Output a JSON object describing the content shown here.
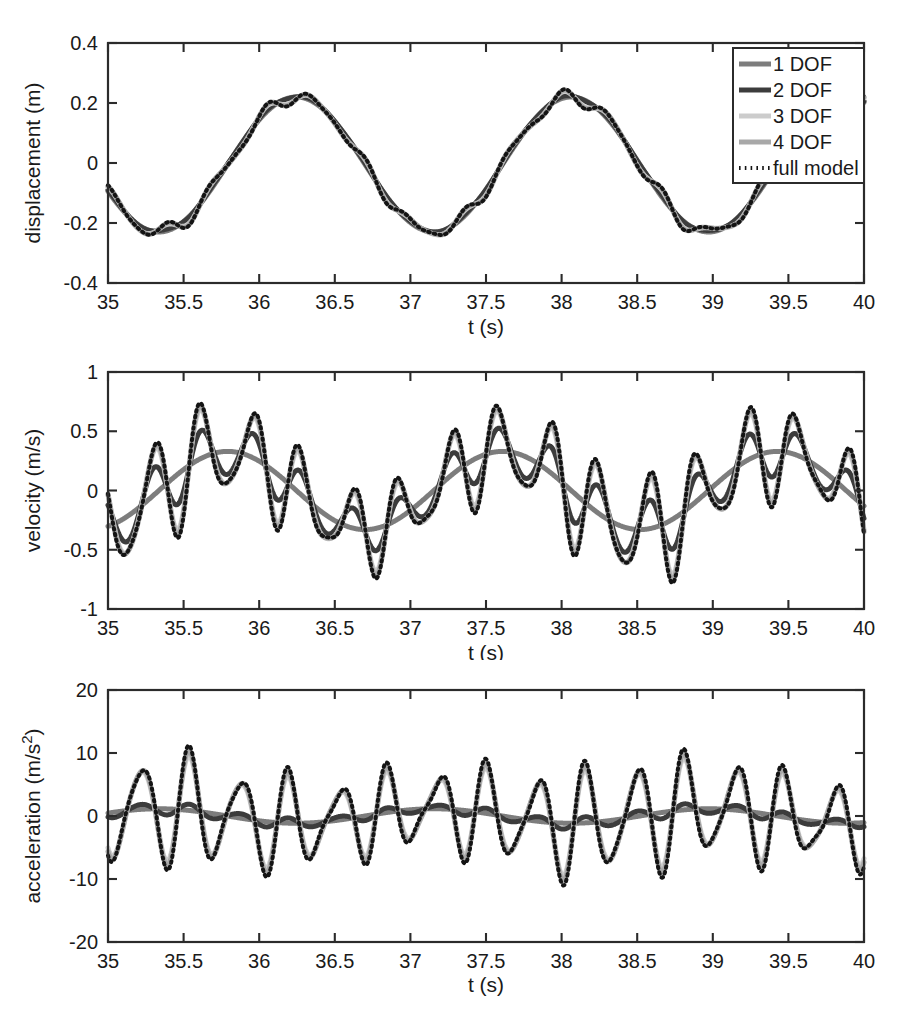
{
  "figure": {
    "title": "",
    "background": "#ffffff",
    "n_subplots": 3
  },
  "legend": {
    "position": "top-right-of-first-subplot",
    "entries": [
      {
        "label": "1 DOF",
        "color": "#7d7d7d",
        "style": "solid",
        "width": 5
      },
      {
        "label": "2 DOF",
        "color": "#3c3c3c",
        "style": "solid",
        "width": 5
      },
      {
        "label": "3 DOF",
        "color": "#cccccc",
        "style": "solid",
        "width": 5
      },
      {
        "label": "4 DOF",
        "color": "#a8a8a8",
        "style": "solid",
        "width": 5
      },
      {
        "label": "full model",
        "color": "#141414",
        "style": "dotted",
        "width": 4
      }
    ]
  },
  "chart_data": [
    {
      "type": "line",
      "id": "displacement",
      "title": "",
      "xlabel": "t (s)",
      "ylabel": "displacement (m)",
      "xlim": [
        35,
        40
      ],
      "ylim": [
        -0.4,
        0.4
      ],
      "xticks": [
        35,
        35.5,
        36,
        36.5,
        37,
        37.5,
        38,
        38.5,
        39,
        39.5,
        40
      ],
      "xticklabels": [
        "35",
        "35.5",
        "36",
        "36.5",
        "37",
        "37.5",
        "38",
        "38.5",
        "39",
        "39.5",
        "40"
      ],
      "yticks": [
        -0.4,
        -0.2,
        0,
        0.2,
        0.4
      ],
      "yticklabels": [
        "-0.4",
        "-0.2",
        "0",
        "0.2",
        "0.4"
      ],
      "grid": false,
      "slow": {
        "amp": 0.225,
        "freq": 0.55,
        "phase": 3.55,
        "offset": -0.005
      },
      "ripple": {
        "amp": 0.022,
        "freq": 3.05,
        "phase": 0.6
      },
      "ripple2": {
        "amp": 0.009,
        "freq": 4.6,
        "phase": 2.1
      },
      "series": [
        {
          "name": "1 DOF",
          "color": "#7d7d7d",
          "style": "solid",
          "width": 5,
          "ripple_scale": 0.0,
          "ripple2_scale": 0.0,
          "dy": 0.0
        },
        {
          "name": "2 DOF",
          "color": "#3c3c3c",
          "style": "solid",
          "width": 5,
          "ripple_scale": 0.18,
          "ripple2_scale": 0.05,
          "dy": 0.002
        },
        {
          "name": "3 DOF",
          "color": "#cccccc",
          "style": "solid",
          "width": 5,
          "ripple_scale": 0.85,
          "ripple2_scale": 0.5,
          "dy": 0.0
        },
        {
          "name": "4 DOF",
          "color": "#a8a8a8",
          "style": "solid",
          "width": 5,
          "ripple_scale": 0.95,
          "ripple2_scale": 0.8,
          "dy": 0.0
        },
        {
          "name": "full model",
          "color": "#141414",
          "style": "dotted",
          "width": 4,
          "ripple_scale": 1.0,
          "ripple2_scale": 1.0,
          "dy": 0.0
        }
      ],
      "notes": "smooth low-frequency carrier, peak ~0.21 m near t=37.05, trough ~-0.27 m near t=38.7, start ~-0.23 m at t=35"
    },
    {
      "type": "line",
      "id": "velocity",
      "title": "",
      "xlabel": "t (s)",
      "ylabel": "velocity (m/s)",
      "xlim": [
        35,
        40
      ],
      "ylim": [
        -1,
        1
      ],
      "xticks": [
        35,
        35.5,
        36,
        36.5,
        37,
        37.5,
        38,
        38.5,
        39,
        39.5,
        40
      ],
      "xticklabels": [
        "35",
        "35.5",
        "36",
        "36.5",
        "37",
        "37.5",
        "38",
        "38.5",
        "39",
        "39.5",
        "40"
      ],
      "yticks": [
        -1,
        -0.5,
        0,
        0.5,
        1
      ],
      "yticklabels": [
        "-1",
        "-0.5",
        "0",
        "0.5",
        "1"
      ],
      "grid": false,
      "slow": {
        "amp": 0.33,
        "freq": 0.55,
        "phase": 5.12,
        "offset": 0.0
      },
      "ripple": {
        "amp": 0.42,
        "freq": 3.05,
        "phase": 2.17
      },
      "ripple2": {
        "amp": 0.13,
        "freq": 4.6,
        "phase": 3.67
      },
      "series": [
        {
          "name": "1 DOF",
          "color": "#7d7d7d",
          "style": "solid",
          "width": 5,
          "ripple_scale": 0.0,
          "ripple2_scale": 0.0,
          "dy": 0.0
        },
        {
          "name": "2 DOF",
          "color": "#3c3c3c",
          "style": "solid",
          "width": 5,
          "ripple_scale": 0.56,
          "ripple2_scale": 0.18,
          "dy": 0.0
        },
        {
          "name": "3 DOF",
          "color": "#cccccc",
          "style": "solid",
          "width": 5,
          "ripple_scale": 0.92,
          "ripple2_scale": 0.72,
          "dy": 0.0
        },
        {
          "name": "4 DOF",
          "color": "#a8a8a8",
          "style": "solid",
          "width": 5,
          "ripple_scale": 0.97,
          "ripple2_scale": 0.88,
          "dy": 0.0
        },
        {
          "name": "full model",
          "color": "#141414",
          "style": "dotted",
          "width": 4,
          "ripple_scale": 1.0,
          "ripple2_scale": 1.0,
          "dy": 0.0
        }
      ],
      "notes": "slow carrier +-0.35 m/s; full model oscillates to ~+0.9 near t=36.0 and ~-0.8 near t=37.45"
    },
    {
      "type": "line",
      "id": "acceleration",
      "title": "",
      "xlabel": "t (s)",
      "ylabel": "acceleration (m/s²)",
      "xlim": [
        35,
        40
      ],
      "ylim": [
        -20,
        20
      ],
      "xticks": [
        35,
        35.5,
        36,
        36.5,
        37,
        37.5,
        38,
        38.5,
        39,
        39.5,
        40
      ],
      "xticklabels": [
        "35",
        "35.5",
        "36",
        "36.5",
        "37",
        "37.5",
        "38",
        "38.5",
        "39",
        "39.5",
        "40"
      ],
      "yticks": [
        -20,
        -10,
        0,
        10,
        20
      ],
      "yticklabels": [
        "-20",
        "-10",
        "0",
        "10",
        "20"
      ],
      "grid": false,
      "slow": {
        "amp": 1.15,
        "freq": 0.55,
        "phase": 0.41,
        "offset": 0.0
      },
      "ripple": {
        "amp": 8.1,
        "freq": 3.05,
        "phase": 3.74
      },
      "ripple2": {
        "amp": 2.6,
        "freq": 4.6,
        "phase": 5.24
      },
      "series": [
        {
          "name": "1 DOF",
          "color": "#7d7d7d",
          "style": "solid",
          "width": 5,
          "ripple_scale": 0.0,
          "ripple2_scale": 0.0,
          "dy": 0.0
        },
        {
          "name": "2 DOF",
          "color": "#3c3c3c",
          "style": "solid",
          "width": 5,
          "ripple_scale": 0.11,
          "ripple2_scale": 0.05,
          "dy": 0.0
        },
        {
          "name": "3 DOF",
          "color": "#cccccc",
          "style": "solid",
          "width": 5,
          "ripple_scale": 0.9,
          "ripple2_scale": 0.66,
          "dy": 0.0
        },
        {
          "name": "4 DOF",
          "color": "#a8a8a8",
          "style": "solid",
          "width": 5,
          "ripple_scale": 0.96,
          "ripple2_scale": 0.8,
          "dy": 0.0
        },
        {
          "name": "full model",
          "color": "#141414",
          "style": "dotted",
          "width": 4,
          "ripple_scale": 1.0,
          "ripple2_scale": 1.0,
          "dy": 0.0
        }
      ],
      "notes": "dominated by high-frequency content, full model peaks near +-10 m/s^2; low-DOF approximations stay near 0"
    }
  ]
}
